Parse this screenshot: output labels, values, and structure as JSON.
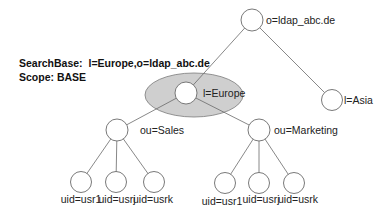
{
  "info": {
    "search_base_label": "SearchBase:",
    "search_base_value": "l=Europe,o=ldap_abc.de",
    "scope_label": "Scope:",
    "scope_value": "BASE"
  },
  "tree": {
    "root": {
      "label": "o=ldap_abc.de"
    },
    "europe": {
      "label": "l=Europe",
      "highlighted": true
    },
    "asia": {
      "label": "l=Asia"
    },
    "sales": {
      "label": "ou=Sales"
    },
    "marketing": {
      "label": "ou=Marketing"
    },
    "sales_users": [
      {
        "label": "uid=usr1"
      },
      {
        "label": "uid=usrj"
      },
      {
        "label": "uid=usrk"
      }
    ],
    "marketing_users": [
      {
        "label": "uid=usr1"
      },
      {
        "label": "uid=usrj"
      },
      {
        "label": "uid=usrk"
      }
    ]
  },
  "colors": {
    "highlight_fill": "#cfcfcf",
    "node_stroke": "#6a6a6a"
  }
}
